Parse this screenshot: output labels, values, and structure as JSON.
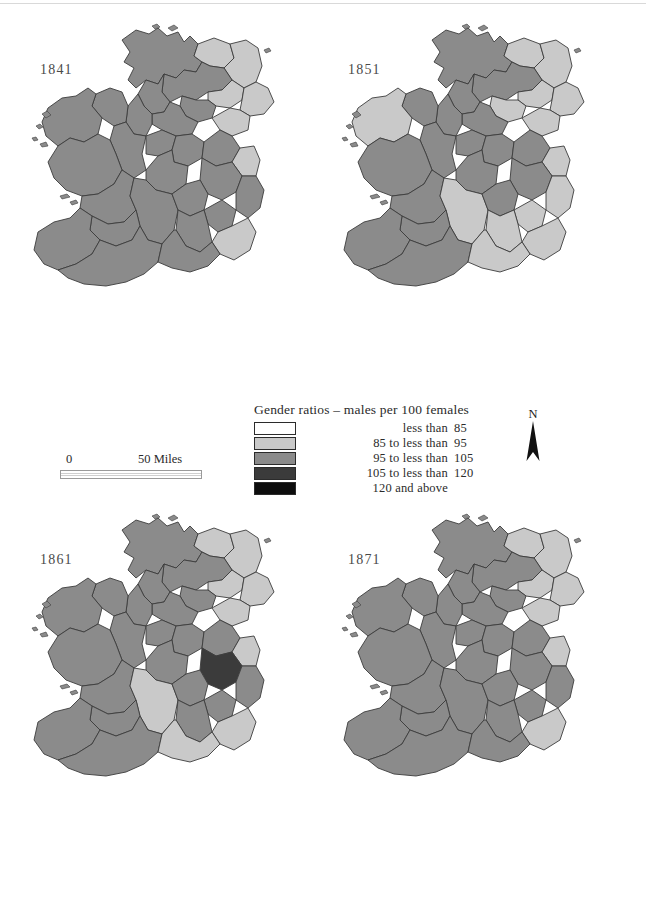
{
  "figure": {
    "kind": "choropleth-map-series",
    "region": "Ireland",
    "panels": [
      {
        "id": "1841",
        "year": "1841"
      },
      {
        "id": "1851",
        "year": "1851"
      },
      {
        "id": "1861",
        "year": "1861"
      },
      {
        "id": "1871",
        "year": "1871"
      }
    ]
  },
  "legend": {
    "title": "Gender ratios – males per 100 females",
    "classes": [
      {
        "label": "less than",
        "value": "85",
        "color": "#ffffff"
      },
      {
        "label": "85 to less than",
        "value": "95",
        "color": "#c9c9c9"
      },
      {
        "label": "95 to less than",
        "value": "105",
        "color": "#8b8b8b"
      },
      {
        "label": "105 to less than",
        "value": "120",
        "color": "#3b3b3b"
      },
      {
        "label": "120 and above",
        "value": "",
        "color": "#0d0d0d"
      }
    ]
  },
  "scalebar": {
    "zero": "0",
    "max": "50 Miles"
  },
  "north_arrow": {
    "label": "N"
  },
  "chart_data": {
    "type": "map",
    "title": "Gender ratios – males per 100 females",
    "map_region": "Ireland (counties)",
    "panels": [
      "1841",
      "1851",
      "1861",
      "1871"
    ],
    "class_breaks": [
      {
        "range": "less than 85",
        "color": "#ffffff"
      },
      {
        "range": "85 to less than 95",
        "color": "#c9c9c9"
      },
      {
        "range": "95 to less than 105",
        "color": "#8b8b8b"
      },
      {
        "range": "105 to less than 120",
        "color": "#3b3b3b"
      },
      {
        "range": "120 and above",
        "color": "#0d0d0d"
      }
    ],
    "series": [
      {
        "name": "1841",
        "counties": {
          "donegal": "95-105",
          "londonderry": "85-95",
          "antrim": "85-95",
          "tyrone": "95-105",
          "fermanagh": "95-105",
          "armagh": "85-95",
          "down": "85-95",
          "monaghan": "95-105",
          "cavan": "95-105",
          "louth": "85-95",
          "leitrim": "95-105",
          "sligo": "95-105",
          "mayo": "95-105",
          "roscommon": "95-105",
          "longford": "95-105",
          "westmeath": "95-105",
          "meath": "95-105",
          "dublin": "85-95",
          "galway": "95-105",
          "offaly": "95-105",
          "kildare": "95-105",
          "wicklow": "95-105",
          "clare": "95-105",
          "tipperary": "95-105",
          "laois": "95-105",
          "carlow": "95-105",
          "wexford": "85-95",
          "limerick": "95-105",
          "kilkenny": "95-105",
          "kerry": "95-105",
          "cork": "95-105",
          "waterford": "95-105"
        }
      },
      {
        "name": "1851",
        "counties": {
          "donegal": "95-105",
          "londonderry": "85-95",
          "antrim": "85-95",
          "tyrone": "95-105",
          "fermanagh": "95-105",
          "armagh": "85-95",
          "down": "85-95",
          "monaghan": "85-95",
          "cavan": "95-105",
          "louth": "85-95",
          "leitrim": "95-105",
          "sligo": "95-105",
          "mayo": "85-95",
          "roscommon": "95-105",
          "longford": "95-105",
          "westmeath": "95-105",
          "meath": "95-105",
          "dublin": "85-95",
          "galway": "95-105",
          "offaly": "95-105",
          "kildare": "95-105",
          "wicklow": "85-95",
          "clare": "95-105",
          "tipperary": "85-95",
          "laois": "95-105",
          "carlow": "85-95",
          "wexford": "85-95",
          "limerick": "95-105",
          "kilkenny": "85-95",
          "kerry": "95-105",
          "cork": "95-105",
          "waterford": "85-95"
        }
      },
      {
        "name": "1861",
        "counties": {
          "donegal": "95-105",
          "londonderry": "85-95",
          "antrim": "85-95",
          "tyrone": "95-105",
          "fermanagh": "95-105",
          "armagh": "85-95",
          "down": "85-95",
          "monaghan": "95-105",
          "cavan": "95-105",
          "louth": "85-95",
          "leitrim": "95-105",
          "sligo": "95-105",
          "mayo": "95-105",
          "roscommon": "95-105",
          "longford": "95-105",
          "westmeath": "95-105",
          "meath": "95-105",
          "dublin": "85-95",
          "galway": "95-105",
          "offaly": "95-105",
          "kildare": "105-120",
          "wicklow": "95-105",
          "clare": "95-105",
          "tipperary": "85-95",
          "laois": "95-105",
          "carlow": "95-105",
          "wexford": "85-95",
          "limerick": "95-105",
          "kilkenny": "95-105",
          "kerry": "95-105",
          "cork": "95-105",
          "waterford": "85-95"
        }
      },
      {
        "name": "1871",
        "counties": {
          "donegal": "95-105",
          "londonderry": "85-95",
          "antrim": "85-95",
          "tyrone": "95-105",
          "fermanagh": "95-105",
          "armagh": "85-95",
          "down": "85-95",
          "monaghan": "95-105",
          "cavan": "95-105",
          "louth": "85-95",
          "leitrim": "95-105",
          "sligo": "95-105",
          "mayo": "95-105",
          "roscommon": "95-105",
          "longford": "95-105",
          "westmeath": "95-105",
          "meath": "95-105",
          "dublin": "85-95",
          "galway": "95-105",
          "offaly": "95-105",
          "kildare": "95-105",
          "wicklow": "95-105",
          "clare": "95-105",
          "tipperary": "95-105",
          "laois": "95-105",
          "carlow": "95-105",
          "wexford": "85-95",
          "limerick": "95-105",
          "kilkenny": "95-105",
          "kerry": "95-105",
          "cork": "95-105",
          "waterford": "95-105"
        }
      }
    ]
  }
}
